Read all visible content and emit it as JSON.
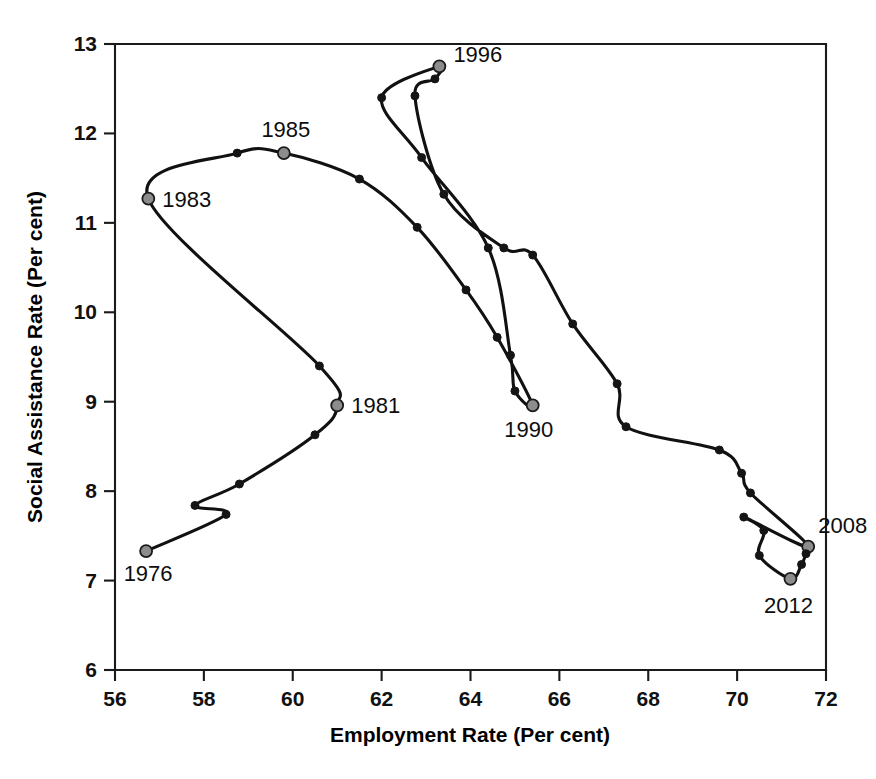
{
  "chart_data": {
    "type": "line",
    "title": "",
    "subtitle": "",
    "xlabel": "Employment Rate (Per cent)",
    "ylabel": "Social Assistance Rate (Per cent)",
    "xlim": [
      56,
      72
    ],
    "ylim": [
      6,
      13
    ],
    "xticks": [
      56,
      58,
      60,
      62,
      64,
      66,
      68,
      70,
      72
    ],
    "yticks": [
      6,
      7,
      8,
      9,
      10,
      11,
      12,
      13
    ],
    "grid": false,
    "legend": null,
    "series": [
      {
        "name": "Employment rate vs social assistance rate",
        "x_name": "Employment Rate (Per cent)",
        "y_name": "Social Assistance Rate (Per cent)",
        "points": [
          {
            "year": "1976",
            "x": 56.7,
            "y": 7.33,
            "labeled": true,
            "label_pos": "below-left"
          },
          {
            "year": "1977",
            "x": 58.5,
            "y": 7.74,
            "labeled": false
          },
          {
            "year": "1978",
            "x": 57.8,
            "y": 7.84,
            "labeled": false
          },
          {
            "year": "1979",
            "x": 58.8,
            "y": 8.08,
            "labeled": false
          },
          {
            "year": "1980",
            "x": 60.5,
            "y": 8.63,
            "labeled": false
          },
          {
            "year": "1981",
            "x": 61.0,
            "y": 8.96,
            "labeled": true,
            "label_pos": "right"
          },
          {
            "year": "1982",
            "x": 60.6,
            "y": 9.4,
            "labeled": false
          },
          {
            "year": "1983",
            "x": 56.75,
            "y": 11.27,
            "labeled": true,
            "label_pos": "right"
          },
          {
            "year": "1984",
            "x": 58.75,
            "y": 11.78,
            "labeled": false
          },
          {
            "year": "1985",
            "x": 59.8,
            "y": 11.78,
            "labeled": true,
            "label_pos": "above"
          },
          {
            "year": "1986",
            "x": 61.5,
            "y": 11.49,
            "labeled": false
          },
          {
            "year": "1987",
            "x": 62.8,
            "y": 10.95,
            "labeled": false
          },
          {
            "year": "1988",
            "x": 63.9,
            "y": 10.25,
            "labeled": false
          },
          {
            "year": "1989",
            "x": 64.6,
            "y": 9.72,
            "labeled": false
          },
          {
            "year": "1990",
            "x": 65.4,
            "y": 8.96,
            "labeled": true,
            "label_pos": "below"
          },
          {
            "year": "1991",
            "x": 65.0,
            "y": 9.12,
            "labeled": false
          },
          {
            "year": "1992",
            "x": 64.9,
            "y": 9.52,
            "labeled": false
          },
          {
            "year": "1993",
            "x": 64.4,
            "y": 10.72,
            "labeled": false
          },
          {
            "year": "1994",
            "x": 62.9,
            "y": 11.73,
            "labeled": false
          },
          {
            "year": "1995",
            "x": 62.0,
            "y": 12.4,
            "labeled": false
          },
          {
            "year": "1996",
            "x": 63.3,
            "y": 12.75,
            "labeled": true,
            "label_pos": "right"
          },
          {
            "year": "1997",
            "x": 63.2,
            "y": 12.61,
            "labeled": false
          },
          {
            "year": "1998",
            "x": 62.75,
            "y": 12.42,
            "labeled": false
          },
          {
            "year": "1999",
            "x": 63.4,
            "y": 11.32,
            "labeled": false
          },
          {
            "year": "2000",
            "x": 64.75,
            "y": 10.72,
            "labeled": false
          },
          {
            "year": "2001",
            "x": 65.4,
            "y": 10.64,
            "labeled": false
          },
          {
            "year": "2002",
            "x": 66.3,
            "y": 9.87,
            "labeled": false
          },
          {
            "year": "2003",
            "x": 67.3,
            "y": 9.2,
            "labeled": false
          },
          {
            "year": "2004",
            "x": 67.5,
            "y": 8.72,
            "labeled": false
          },
          {
            "year": "2005",
            "x": 69.6,
            "y": 8.46,
            "labeled": false
          },
          {
            "year": "2006",
            "x": 70.1,
            "y": 8.2,
            "labeled": false
          },
          {
            "year": "2007",
            "x": 70.3,
            "y": 7.98,
            "labeled": false
          },
          {
            "year": "2008",
            "x": 71.6,
            "y": 7.38,
            "labeled": true,
            "label_pos": "above-left"
          },
          {
            "year": "2009",
            "x": 70.15,
            "y": 7.71,
            "labeled": false
          },
          {
            "year": "2010",
            "x": 70.6,
            "y": 7.56,
            "labeled": false
          },
          {
            "year": "2011",
            "x": 70.5,
            "y": 7.28,
            "labeled": false
          },
          {
            "year": "2012",
            "x": 71.2,
            "y": 7.02,
            "labeled": true,
            "label_pos": "below"
          },
          {
            "year": "2013",
            "x": 71.45,
            "y": 7.18,
            "labeled": false
          },
          {
            "year": "2014",
            "x": 71.55,
            "y": 7.3,
            "labeled": false
          }
        ],
        "labeled_years": [
          "1976",
          "1981",
          "1983",
          "1985",
          "1990",
          "1996",
          "2008",
          "2012"
        ]
      }
    ],
    "annotations": [
      {
        "text": "1976",
        "x": 56.7,
        "y": 7.33
      },
      {
        "text": "1981",
        "x": 61.0,
        "y": 8.96
      },
      {
        "text": "1983",
        "x": 56.75,
        "y": 11.27
      },
      {
        "text": "1985",
        "x": 59.8,
        "y": 11.78
      },
      {
        "text": "1990",
        "x": 65.4,
        "y": 8.96
      },
      {
        "text": "1996",
        "x": 63.3,
        "y": 12.75
      },
      {
        "text": "2008",
        "x": 71.6,
        "y": 7.38
      },
      {
        "text": "2012",
        "x": 71.2,
        "y": 7.02
      }
    ],
    "colors": {
      "line": "#111111",
      "marker_minor": "#151515",
      "marker_major": "#8c8c8c",
      "marker_major_edge": "#1a1a1a",
      "axis": "#1a1a1a",
      "background": "#ffffff",
      "text": "#000000"
    }
  },
  "axes": {
    "x": {
      "title": "Employment Rate (Per cent)",
      "ticks": [
        "56",
        "58",
        "60",
        "62",
        "64",
        "66",
        "68",
        "70",
        "72"
      ]
    },
    "y": {
      "title": "Social Assistance Rate (Per cent)",
      "ticks": [
        "6",
        "7",
        "8",
        "9",
        "10",
        "11",
        "12",
        "13"
      ]
    }
  }
}
